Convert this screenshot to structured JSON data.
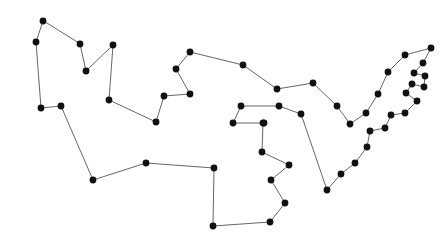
{
  "figure": {
    "title": "",
    "background_color": "#ffffff",
    "width": 444,
    "height": 244,
    "shape_type": "closed-polygon-outline"
  },
  "style": {
    "line_color": "#555555",
    "line_width": 0.9,
    "dot_color": "#111111",
    "dot_radius": 3.4,
    "closed": true
  },
  "chart_data": {
    "type": "scatter",
    "title": "",
    "xlabel": "",
    "ylabel": "",
    "grid": false,
    "legend": false,
    "xlim": [
      0,
      444
    ],
    "ylim": [
      0,
      244
    ],
    "closed_path": true,
    "point_count": 53,
    "points": [
      [
        43,
        21
      ],
      [
        36,
        42
      ],
      [
        41,
        108
      ],
      [
        61,
        106
      ],
      [
        93,
        180
      ],
      [
        146,
        163
      ],
      [
        214,
        168
      ],
      [
        213,
        226
      ],
      [
        270,
        222
      ],
      [
        285,
        203
      ],
      [
        271,
        180
      ],
      [
        289,
        165
      ],
      [
        262,
        152
      ],
      [
        263,
        123
      ],
      [
        279,
        106
      ],
      [
        301,
        114
      ],
      [
        327,
        190
      ],
      [
        341,
        174
      ],
      [
        355,
        163
      ],
      [
        367,
        147
      ],
      [
        370,
        131
      ],
      [
        385,
        128
      ],
      [
        391,
        115
      ],
      [
        405,
        113
      ],
      [
        417,
        101
      ],
      [
        406,
        93
      ],
      [
        412,
        84
      ],
      [
        424,
        87
      ],
      [
        425,
        76
      ],
      [
        414,
        73
      ],
      [
        423,
        63
      ],
      [
        431,
        48
      ],
      [
        405,
        55
      ],
      [
        388,
        72
      ],
      [
        378,
        94
      ],
      [
        366,
        113
      ],
      [
        350,
        124
      ],
      [
        337,
        106
      ],
      [
        313,
        83
      ],
      [
        277,
        89
      ],
      [
        243,
        65
      ],
      [
        190,
        52
      ],
      [
        176,
        69
      ],
      [
        190,
        94
      ],
      [
        164,
        96
      ],
      [
        156,
        122
      ],
      [
        241,
        106
      ],
      [
        233,
        123
      ],
      [
        264,
        123
      ],
      [
        109,
        100
      ],
      [
        113,
        45
      ],
      [
        86,
        71
      ],
      [
        80,
        44
      ]
    ],
    "path_order": [
      "43,21",
      "36,42",
      "41,108",
      "61,106",
      "93,180",
      "146,163",
      "214,168",
      "213,226",
      "270,222",
      "285,203",
      "271,180",
      "289,165",
      "262,152",
      "263,123",
      "233,123",
      "241,106",
      "279,106",
      "301,114",
      "327,190",
      "341,174",
      "355,163",
      "367,147",
      "370,131",
      "385,128",
      "391,115",
      "405,113",
      "417,101",
      "406,93",
      "412,84",
      "424,87",
      "425,76",
      "414,73",
      "423,63",
      "431,48",
      "405,55",
      "388,72",
      "378,94",
      "366,113",
      "350,124",
      "337,106",
      "313,83",
      "277,89",
      "243,65",
      "190,52",
      "176,69",
      "190,94",
      "164,96",
      "156,122",
      "109,100",
      "113,45",
      "86,71",
      "80,44"
    ]
  }
}
